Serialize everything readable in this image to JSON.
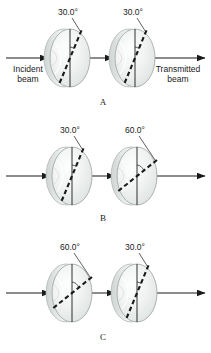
{
  "figure": {
    "background_color": "#ffffff",
    "ink_color": "#1a1a1a",
    "disk_color": "#e9eceb",
    "disk_edge_color": "#8f9694"
  },
  "labels": {
    "incident_beam": "Incident\nbeam",
    "incident_beam_line1": "Incident",
    "incident_beam_line2": "beam",
    "transmitted_beam_line1": "Transmitted",
    "transmitted_beam_line2": "beam"
  },
  "panels": [
    {
      "id": "A",
      "label": "A",
      "label_x": 103,
      "label_y": 105,
      "axis_y": 58,
      "shows_beam_labels": true,
      "disks": [
        {
          "index": 0,
          "angle_label": "30.0°",
          "angle_deg": 30,
          "cx": 70,
          "cy": 58,
          "rx": 20,
          "ry": 29,
          "callout_text_x": 68,
          "callout_text_y": 15
        },
        {
          "index": 1,
          "angle_label": "30.0°",
          "angle_deg": 30,
          "cx": 135,
          "cy": 58,
          "rx": 20,
          "ry": 29,
          "callout_text_x": 133,
          "callout_text_y": 15
        }
      ]
    },
    {
      "id": "B",
      "label": "B",
      "label_x": 103,
      "label_y": 221,
      "axis_y": 176,
      "shows_beam_labels": false,
      "disks": [
        {
          "index": 0,
          "angle_label": "30.0°",
          "angle_deg": 30,
          "cx": 72,
          "cy": 176,
          "rx": 20,
          "ry": 29,
          "callout_text_x": 70,
          "callout_text_y": 133
        },
        {
          "index": 1,
          "angle_label": "60.0°",
          "angle_deg": 60,
          "cx": 137,
          "cy": 176,
          "rx": 20,
          "ry": 29,
          "callout_text_x": 135,
          "callout_text_y": 133
        }
      ]
    },
    {
      "id": "C",
      "label": "C",
      "label_x": 103,
      "label_y": 340,
      "axis_y": 293,
      "shows_beam_labels": false,
      "disks": [
        {
          "index": 0,
          "angle_label": "60.0°",
          "angle_deg": 60,
          "cx": 72,
          "cy": 293,
          "rx": 20,
          "ry": 29,
          "callout_text_x": 70,
          "callout_text_y": 250
        },
        {
          "index": 1,
          "angle_label": "30.0°",
          "angle_deg": 30,
          "cx": 137,
          "cy": 293,
          "rx": 20,
          "ry": 29,
          "callout_text_x": 135,
          "callout_text_y": 250
        }
      ]
    }
  ]
}
